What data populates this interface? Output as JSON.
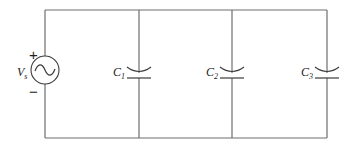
{
  "diagram": {
    "type": "circuit",
    "source": {
      "label": "V",
      "subscript": "s",
      "kind": "ac-voltage-source",
      "plus": "+",
      "minus": "−"
    },
    "capacitors": [
      {
        "label": "C",
        "subscript": "1"
      },
      {
        "label": "C",
        "subscript": "2"
      },
      {
        "label": "C",
        "subscript": "3"
      }
    ],
    "colors": {
      "wire": "#6e6e6e",
      "component": "#3a3a3a",
      "background": "#ffffff"
    }
  }
}
